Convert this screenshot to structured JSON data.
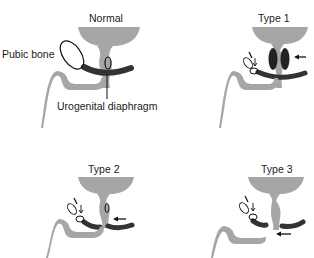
{
  "figure": {
    "panels": [
      {
        "id": "normal",
        "title": "Normal"
      },
      {
        "id": "type1",
        "title": "Type 1"
      },
      {
        "id": "type2",
        "title": "Type 2"
      },
      {
        "id": "type3",
        "title": "Type 3"
      }
    ],
    "labels": {
      "pubic_bone": "Pubic bone",
      "urogenital_diaphragm": "Urogenital diaphragm"
    },
    "colors": {
      "tissue_gray": "#a6a6a6",
      "diaphragm_dark": "#333333",
      "outline": "#111111",
      "background": "#ffffff"
    }
  }
}
